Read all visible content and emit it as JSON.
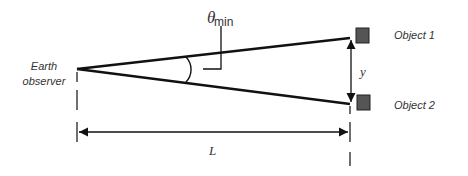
{
  "diagram": {
    "labels": {
      "observer_line1": "Earth",
      "observer_line2": "observer",
      "theta": "θ",
      "theta_sub": "min",
      "object1": "Object 1",
      "object2": "Object 2",
      "separation": "y",
      "distance": "L"
    },
    "colors": {
      "line": "#111111",
      "object_fill": "#555555",
      "object_stroke": "#222222",
      "text": "#333333"
    }
  }
}
